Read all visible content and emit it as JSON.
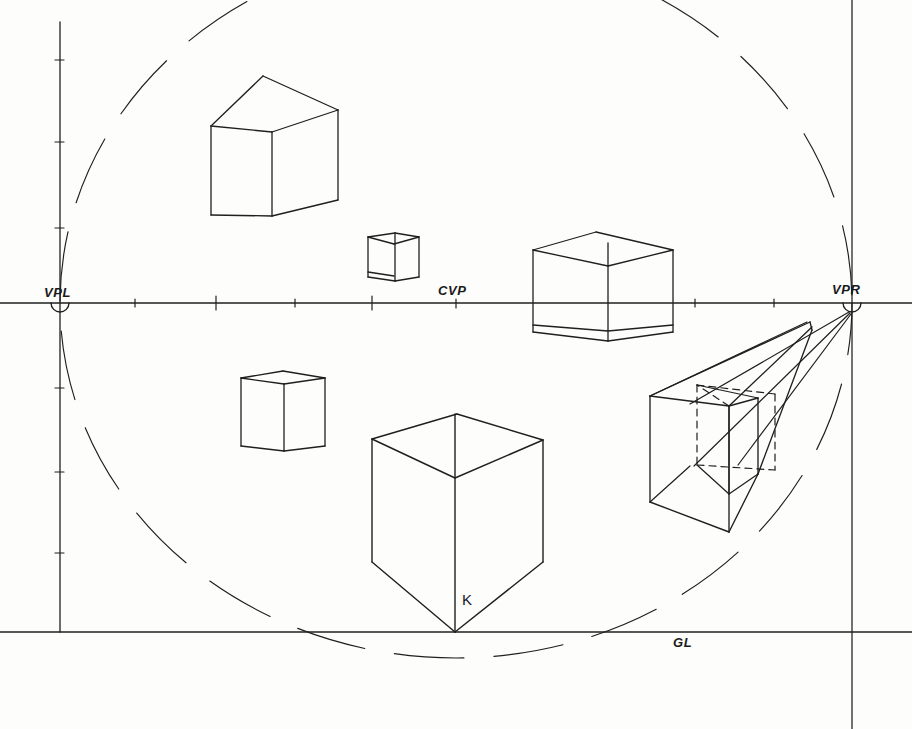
{
  "drawing": {
    "title": "Two-point perspective construction with cubes",
    "background_color": "#fdfdfc",
    "ink_color": "#1f1f1f",
    "line_width": 1.3,
    "canvas": {
      "width": 912,
      "height": 729
    }
  },
  "labels": {
    "vpl": "VPL",
    "vpr": "VPR",
    "cvp": "CVP",
    "gl": "GL",
    "k": "K"
  },
  "reference_lines": {
    "horizon": {
      "name": "horizon-line",
      "y": 303,
      "x1": 0,
      "x2": 912
    },
    "ground": {
      "name": "ground-line",
      "y": 632,
      "x1": 0,
      "x2": 912
    },
    "left_vertical_axis": {
      "name": "station-axis",
      "x": 60,
      "y1": 22,
      "y2": 632
    }
  },
  "vanishing_points": {
    "vpl": {
      "x": 60,
      "y": 303,
      "radius": 9
    },
    "vpr": {
      "x": 852,
      "y": 303,
      "radius": 9
    },
    "cvp": {
      "x": 456,
      "y": 303
    }
  },
  "horizon_ticks": [
    {
      "x": 135,
      "h": 4
    },
    {
      "x": 216,
      "h": 7
    },
    {
      "x": 295,
      "h": 4
    },
    {
      "x": 372,
      "h": 7
    },
    {
      "x": 456,
      "h": 5
    },
    {
      "x": 535,
      "h": 24
    },
    {
      "x": 595,
      "h": 24
    },
    {
      "x": 610,
      "h": 30
    },
    {
      "x": 655,
      "h": 22
    },
    {
      "x": 695,
      "h": 5
    },
    {
      "x": 774,
      "h": 5
    }
  ],
  "axis_ticks": [
    {
      "y": 60,
      "w": 9
    },
    {
      "y": 142,
      "w": 9
    },
    {
      "y": 228,
      "w": 9
    },
    {
      "y": 388,
      "w": 9
    },
    {
      "y": 472,
      "w": 9
    },
    {
      "y": 553,
      "w": 9
    }
  ],
  "station_circle": {
    "name": "station-point-circle",
    "cx": 456,
    "cy": 303,
    "rx": 396,
    "ry": 355,
    "style": "dashed",
    "dash": "62 26"
  },
  "cubes": [
    {
      "name": "cube-upper-left",
      "position": "above horizon, left",
      "faces_visible": [
        "left",
        "right",
        "bottom"
      ]
    },
    {
      "name": "cube-small-center",
      "position": "near horizon, center",
      "faces_visible": [
        "left",
        "right",
        "top",
        "bottom"
      ]
    },
    {
      "name": "cube-horizon-right",
      "position": "straddling horizon, right of center",
      "faces_visible": [
        "left",
        "right",
        "top",
        "bottom"
      ]
    },
    {
      "name": "cube-lower-left",
      "position": "below horizon, left",
      "faces_visible": [
        "left",
        "right",
        "top"
      ]
    },
    {
      "name": "cube-large-foreground",
      "position": "below horizon, center, corner K touches ground line",
      "faces_visible": [
        "left",
        "right",
        "top"
      ]
    },
    {
      "name": "box-long-right",
      "position": "below horizon, right, receding to VPR",
      "faces_visible": [
        "front",
        "left",
        "top",
        "bottom"
      ],
      "has_inscribed_dashed_cube": true
    }
  ],
  "projection_rays": {
    "name": "vpr-convergence-rays",
    "origin": "VPR",
    "count": 5
  }
}
